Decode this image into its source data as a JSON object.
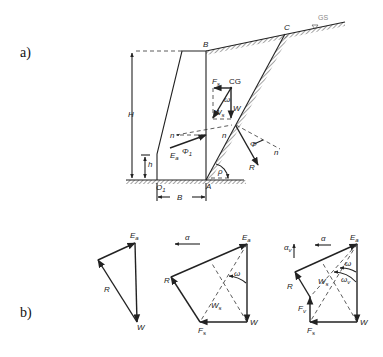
{
  "figure": {
    "part_a_label": "a)",
    "part_b_label": "b)",
    "wall": {
      "labels": {
        "B_top": "B",
        "C": "C",
        "GS": "GS",
        "H": "H",
        "h": "h",
        "O1": "O",
        "O1_sub": "1",
        "A": "A",
        "B_width": "B",
        "Fs": "F",
        "Fs_sub": "s",
        "CG": "CG",
        "omega": "ω",
        "Ws": "W",
        "Ws_sub": "s",
        "W": "W",
        "n_left": "n",
        "n_mid": "n",
        "n_right": "n",
        "Phi1": "Φ",
        "Phi1_sub": "1",
        "Phi": "Φ",
        "Ea": "E",
        "Ea_sub": "a",
        "R": "R",
        "rho": "ρ"
      }
    },
    "polygons": [
      {
        "name": "static",
        "labels": {
          "Ea": "E",
          "Ea_sub": "a",
          "R": "R",
          "W": "W"
        }
      },
      {
        "name": "horizontal-seismic",
        "labels": {
          "alpha": "α",
          "Ea": "E",
          "Ea_sub": "a",
          "R": "R",
          "omega": "ω",
          "Ws": "W",
          "Ws_sub": "s",
          "Fs": "F",
          "Fs_sub": "s",
          "W": "W"
        }
      },
      {
        "name": "vertical-seismic",
        "labels": {
          "alpha": "α",
          "alpha_v": "α",
          "alpha_v_sub": "v",
          "Ea": "E",
          "Ea_sub": "a",
          "R": "R",
          "omega": "ω",
          "omega_v": "ω",
          "omega_v_sub": "v",
          "Ws": "W",
          "Ws_sub": "s",
          "Fv": "F",
          "Fv_sub": "v",
          "Fs": "F",
          "Fs_sub": "s",
          "W": "W"
        }
      }
    ]
  }
}
